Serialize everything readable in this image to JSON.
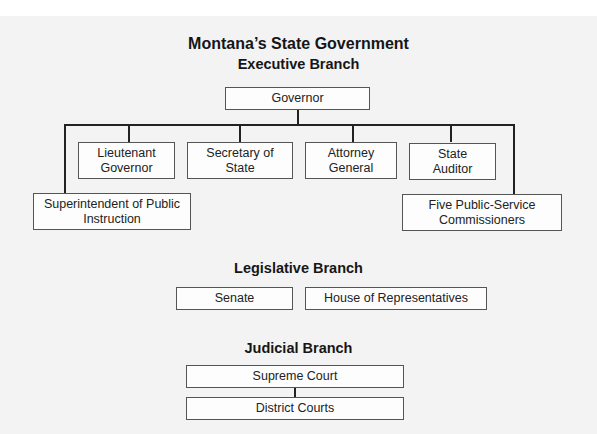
{
  "title": "Montana’s State Government",
  "executive": {
    "heading": "Executive Branch",
    "head": "Governor",
    "offices": [
      "Lieutenant Governor",
      "Secretary of State",
      "Attorney General",
      "State Auditor"
    ],
    "outer_offices": [
      "Superintendent of Public Instruction",
      "Five Public-Service Commissioners"
    ]
  },
  "legislative": {
    "heading": "Legislative Branch",
    "chambers": [
      "Senate",
      "House of Representatives"
    ]
  },
  "judicial": {
    "heading": "Judicial Branch",
    "courts": [
      "Supreme Court",
      "District Courts"
    ]
  },
  "colors": {
    "background": "#f3f3f3",
    "box_fill": "#fdfdfd",
    "box_border": "#555555",
    "line": "#222222",
    "text": "#1a1a1a"
  }
}
